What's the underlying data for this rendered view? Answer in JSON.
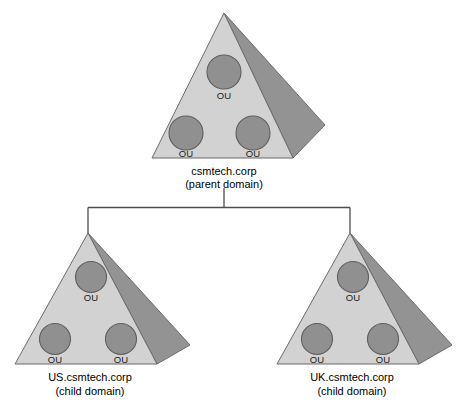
{
  "diagram": {
    "type": "hierarchy-tree",
    "colors": {
      "background": "#ffffff",
      "pyramid_front_face": "#d2d2d2",
      "pyramid_side_face": "#939393",
      "pyramid_outline": "#6b6b6b",
      "ou_circle_fill": "#909090",
      "ou_circle_outline": "#5e5e5e",
      "connector_line": "#4d4d4d",
      "label_text": "#000000"
    },
    "ou_label": "OU",
    "nodes": [
      {
        "id": "parent",
        "name": "csmtech.corp",
        "role": "(parent domain)",
        "ou_count": 3,
        "ou_labels": [
          "OU",
          "OU",
          "OU"
        ]
      },
      {
        "id": "child-us",
        "name": "US.csmtech.corp",
        "role": "(child domain)",
        "ou_count": 3,
        "ou_labels": [
          "OU",
          "OU",
          "OU"
        ]
      },
      {
        "id": "child-uk",
        "name": "UK.csmtech.corp",
        "role": "(child domain)",
        "ou_count": 3,
        "ou_labels": [
          "OU",
          "OU",
          "OU"
        ]
      }
    ],
    "edges": [
      {
        "from": "csmtech.corp",
        "to": "US.csmtech.corp"
      },
      {
        "from": "csmtech.corp",
        "to": "UK.csmtech.corp"
      }
    ]
  }
}
